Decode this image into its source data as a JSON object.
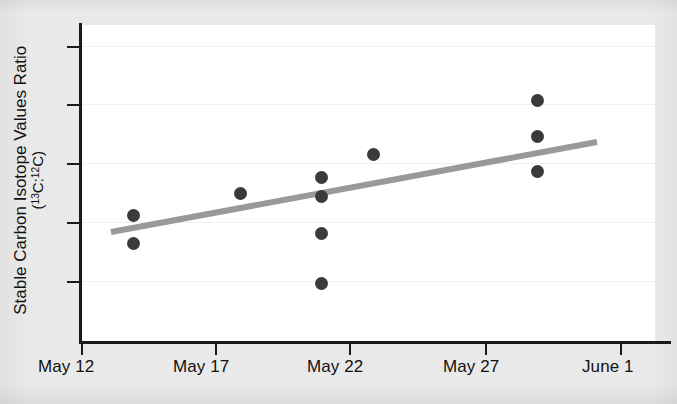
{
  "figure": {
    "background_color": "#e9e9e9",
    "panel_color": "#ffffff",
    "axis_color": "#1a1a1a",
    "dot_color": "#3a3a3a",
    "trend_color": "#999999"
  },
  "chart_data": {
    "type": "scatter",
    "title": "",
    "subtitle": "",
    "xlabel": "",
    "ylabel_line1": "Stable Carbon Isotope Values Ratio",
    "ylabel_line2_prefix": "(",
    "ylabel_line2_sup1": "13",
    "ylabel_line2_mid": "C:",
    "ylabel_line2_sup2": "12",
    "ylabel_line2_suffix": "C)",
    "x_tick_labels": [
      "May 12",
      "May 17",
      "May 22",
      "May 27",
      "June 1"
    ],
    "x_tick_positions_px": [
      81,
      215,
      349,
      485,
      620
    ],
    "y_tick_labels": [
      "",
      "",
      "",
      "",
      ""
    ],
    "y_tick_positions_px": [
      46,
      104,
      163,
      222,
      281
    ],
    "grid": "horizontal-faint",
    "legend": "none",
    "x_axis_type": "date",
    "x_range": [
      "May 12",
      "June 1"
    ],
    "y_range_labeled": false,
    "points": [
      {
        "date": "May 14",
        "x_px": 133,
        "y_px": 215,
        "y_rel": 0.64
      },
      {
        "date": "May 14",
        "x_px": 133,
        "y_px": 243,
        "y_rel": 0.55
      },
      {
        "date": "May 18",
        "x_px": 240,
        "y_px": 193,
        "y_rel": 0.71
      },
      {
        "date": "May 21",
        "x_px": 321,
        "y_px": 177,
        "y_rel": 0.76
      },
      {
        "date": "May 21",
        "x_px": 321,
        "y_px": 196,
        "y_rel": 0.7
      },
      {
        "date": "May 21",
        "x_px": 321,
        "y_px": 233,
        "y_rel": 0.58
      },
      {
        "date": "May 21",
        "x_px": 321,
        "y_px": 283,
        "y_rel": 0.42
      },
      {
        "date": "May 23",
        "x_px": 373,
        "y_px": 154,
        "y_rel": 0.83
      },
      {
        "date": "May 29",
        "x_px": 537,
        "y_px": 100,
        "y_rel": 1.0
      },
      {
        "date": "May 29",
        "x_px": 537,
        "y_px": 136,
        "y_rel": 0.89
      },
      {
        "date": "May 29",
        "x_px": 537,
        "y_px": 171,
        "y_rel": 0.78
      }
    ],
    "trend_line": {
      "label": "linear fit",
      "slope_sign": "positive",
      "x1_px": 111,
      "y1_px": 232,
      "x2_px": 597,
      "y2_px": 142,
      "color": "#999999",
      "width_px": 6
    }
  }
}
